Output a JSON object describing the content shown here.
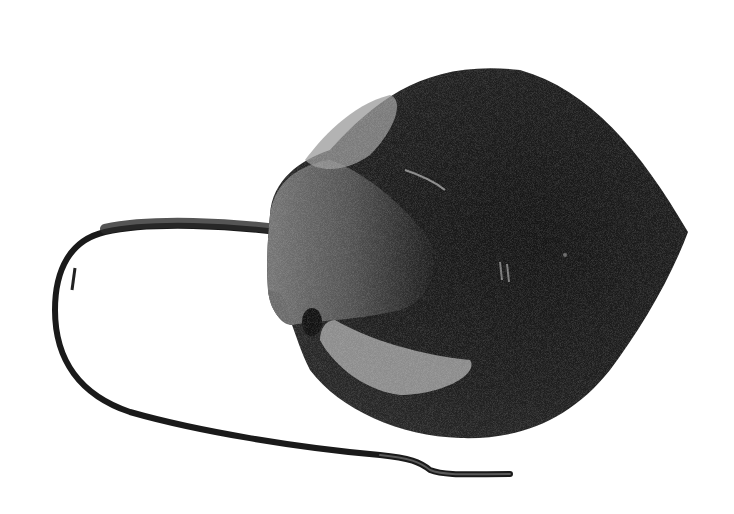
{
  "image": {
    "subject": "Stingray illustration",
    "description": "Black-and-white stippled engraving of a stingray seen from above, with a long whip-like tail curving left and back under the body.",
    "colors": {
      "background": "#ffffff",
      "body_dark": "#1c1c1c",
      "body_mid": "#3a3a3a",
      "highlight": "#9a9a9a",
      "light_patch": "#c8c8c8"
    }
  }
}
